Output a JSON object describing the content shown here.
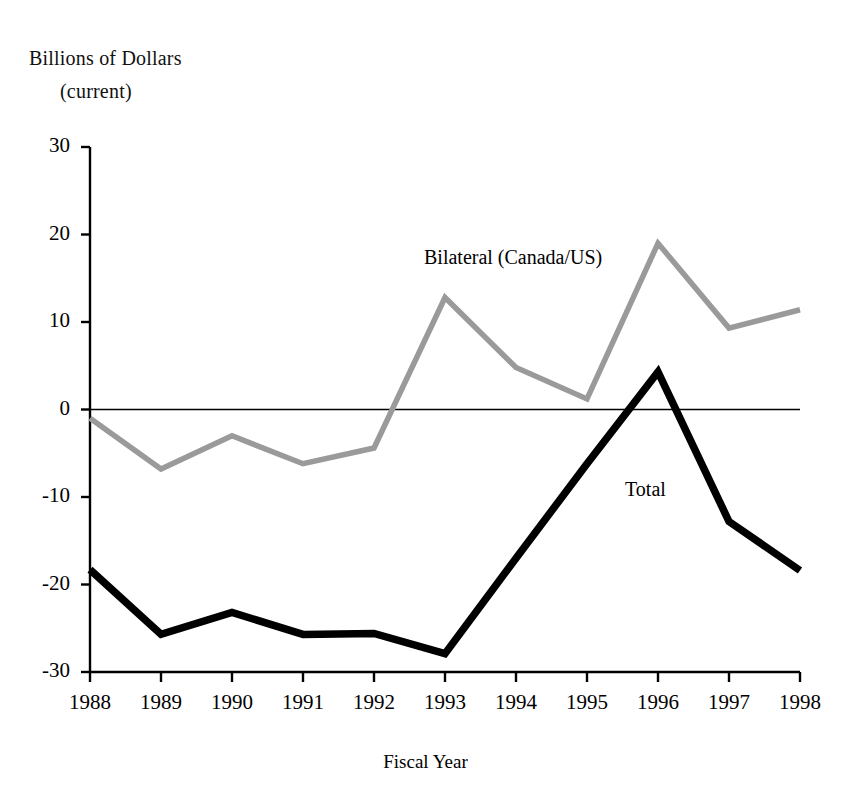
{
  "figure": {
    "y_axis_title_main": "Billions of Dollars",
    "y_axis_title_sub": "(current)",
    "x_axis_title": "Fiscal Year",
    "bilateral_label": "Bilateral (Canada/US)",
    "total_label": "Total",
    "colors": {
      "bilateral": "#9a9a9a",
      "total": "#000000",
      "axis": "#000000",
      "background": "#ffffff"
    }
  },
  "chart_data": {
    "type": "line",
    "title": "",
    "subtitle": "",
    "xlabel": "Fiscal Year",
    "ylabel": "Billions of Dollars (current)",
    "grid": false,
    "legend": "inline-annotations",
    "categories": [
      "1988",
      "1989",
      "1990",
      "1991",
      "1992",
      "1993",
      "1994",
      "1995",
      "1996",
      "1997",
      "1998"
    ],
    "x": [
      1988,
      1989,
      1990,
      1991,
      1992,
      1993,
      1994,
      1995,
      1996,
      1997,
      1998
    ],
    "xlim": [
      1988,
      1998
    ],
    "ylim": [
      -30,
      30
    ],
    "yticks": [
      30,
      20,
      10,
      0,
      -10,
      -20,
      -30
    ],
    "ytick_labels": [
      "30",
      "20",
      "10",
      "0",
      "-10",
      "-20",
      "-30"
    ],
    "xtick_labels": [
      "1988",
      "1989",
      "1990",
      "1991",
      "1992",
      "1993",
      "1994",
      "1995",
      "1996",
      "1997",
      "1998"
    ],
    "zero_line": 0,
    "series": [
      {
        "name": "Bilateral (Canada/US)",
        "color": "#9a9a9a",
        "values": [
          -1.0,
          -6.8,
          -3.0,
          -6.2,
          -4.4,
          12.8,
          4.8,
          1.2,
          19.0,
          9.3,
          11.4
        ]
      },
      {
        "name": "Total",
        "color": "#000000",
        "values": [
          -18.3,
          -25.7,
          -23.2,
          -25.7,
          -25.6,
          -27.9,
          -17.0,
          -6.2,
          4.3,
          -12.8,
          -18.4
        ]
      }
    ]
  }
}
